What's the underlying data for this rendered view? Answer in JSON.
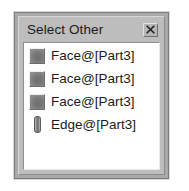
{
  "dialog": {
    "title": "Select Other",
    "close_icon": "close-icon",
    "close_label": "Close",
    "items": [
      {
        "label": "Face@[Part3]",
        "icon": "face-icon"
      },
      {
        "label": "Face@[Part3]",
        "icon": "face-icon"
      },
      {
        "label": "Face@[Part3]",
        "icon": "face-icon"
      },
      {
        "label": "Edge@[Part3]",
        "icon": "edge-icon"
      }
    ]
  },
  "colors": {
    "dialog_face": "#bdbdbd",
    "dialog_frame": "#a9a9a9",
    "list_background": "#fefefe",
    "text": "#1b1b1b",
    "icon_gray": "#767676"
  }
}
